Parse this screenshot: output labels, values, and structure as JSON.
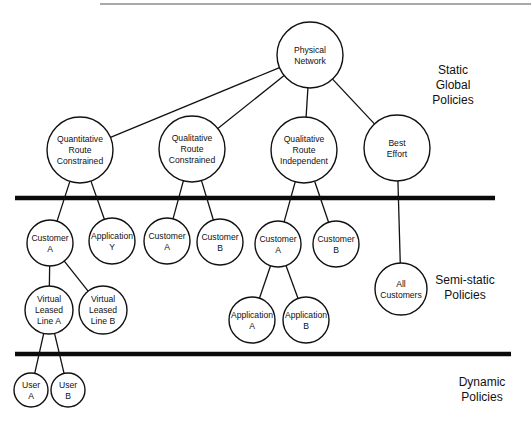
{
  "diagram": {
    "layers": [
      {
        "id": "static",
        "lines": [
          "Static",
          "Global",
          "Policies"
        ],
        "x": 453,
        "y": 74
      },
      {
        "id": "semi-static",
        "lines": [
          "Semi-static",
          "Policies"
        ],
        "x": 465,
        "y": 284
      },
      {
        "id": "dynamic",
        "lines": [
          "Dynamic",
          "Policies"
        ],
        "x": 482,
        "y": 386
      }
    ],
    "separators": [
      {
        "id": "top-rule",
        "x1": 100,
        "x2": 531,
        "y": 4,
        "kind": "thin"
      },
      {
        "id": "static-semistatic-divider",
        "x1": 15,
        "x2": 495,
        "y": 198,
        "kind": "thick"
      },
      {
        "id": "semistatic-dynamic-divider",
        "x1": 15,
        "x2": 511,
        "y": 354,
        "kind": "thick"
      }
    ],
    "nodes": [
      {
        "id": "physical-network",
        "lines": [
          "Physical",
          "Network"
        ],
        "cx": 310,
        "cy": 55,
        "r": 33
      },
      {
        "id": "quantitative-route-constrained",
        "lines": [
          "Quantitative",
          "Route",
          "Constrained"
        ],
        "cx": 80,
        "cy": 150,
        "r": 33
      },
      {
        "id": "qualitative-route-constrained",
        "lines": [
          "Qualitative",
          "Route",
          "Constrained"
        ],
        "cx": 192,
        "cy": 149,
        "r": 33
      },
      {
        "id": "qualitative-route-independent",
        "lines": [
          "Qualitative",
          "Route",
          "Independent"
        ],
        "cx": 304,
        "cy": 150,
        "r": 33
      },
      {
        "id": "best-effort",
        "lines": [
          "Best",
          "Effort"
        ],
        "cx": 397,
        "cy": 148,
        "r": 33
      },
      {
        "id": "qrc-customer-a",
        "lines": [
          "Customer",
          "A"
        ],
        "cx": 50,
        "cy": 243,
        "r": 23
      },
      {
        "id": "qrc-application-y",
        "lines": [
          "Application",
          "Y"
        ],
        "cx": 112,
        "cy": 241,
        "r": 23
      },
      {
        "id": "qlc-customer-a",
        "lines": [
          "Customer",
          "A"
        ],
        "cx": 167,
        "cy": 241,
        "r": 23
      },
      {
        "id": "qlc-customer-b",
        "lines": [
          "Customer",
          "B"
        ],
        "cx": 220,
        "cy": 242,
        "r": 23
      },
      {
        "id": "qli-customer-a",
        "lines": [
          "Customer",
          "A"
        ],
        "cx": 278,
        "cy": 244,
        "r": 23
      },
      {
        "id": "qli-customer-b",
        "lines": [
          "Customer",
          "B"
        ],
        "cx": 336,
        "cy": 244,
        "r": 23
      },
      {
        "id": "all-customers",
        "lines": [
          "All",
          "Customers"
        ],
        "cx": 401,
        "cy": 289,
        "r": 26
      },
      {
        "id": "virtual-leased-line-a",
        "lines": [
          "Virtual",
          "Leased",
          "Line A"
        ],
        "cx": 49,
        "cy": 310,
        "r": 24
      },
      {
        "id": "virtual-leased-line-b",
        "lines": [
          "Virtual",
          "Leased",
          "Line B"
        ],
        "cx": 103,
        "cy": 310,
        "r": 24
      },
      {
        "id": "application-a",
        "lines": [
          "Application",
          "A"
        ],
        "cx": 252,
        "cy": 320,
        "r": 23
      },
      {
        "id": "application-b",
        "lines": [
          "Application",
          "B"
        ],
        "cx": 306,
        "cy": 320,
        "r": 23
      },
      {
        "id": "user-a",
        "lines": [
          "User",
          "A"
        ],
        "cx": 31,
        "cy": 390,
        "r": 17
      },
      {
        "id": "user-b",
        "lines": [
          "User",
          "B"
        ],
        "cx": 68,
        "cy": 390,
        "r": 17
      }
    ],
    "edges": [
      [
        "physical-network",
        "quantitative-route-constrained"
      ],
      [
        "physical-network",
        "qualitative-route-constrained"
      ],
      [
        "physical-network",
        "qualitative-route-independent"
      ],
      [
        "physical-network",
        "best-effort"
      ],
      [
        "quantitative-route-constrained",
        "qrc-customer-a"
      ],
      [
        "quantitative-route-constrained",
        "qrc-application-y"
      ],
      [
        "qualitative-route-constrained",
        "qlc-customer-a"
      ],
      [
        "qualitative-route-constrained",
        "qlc-customer-b"
      ],
      [
        "qualitative-route-independent",
        "qli-customer-a"
      ],
      [
        "qualitative-route-independent",
        "qli-customer-b"
      ],
      [
        "best-effort",
        "all-customers"
      ],
      [
        "qrc-customer-a",
        "virtual-leased-line-a"
      ],
      [
        "qrc-customer-a",
        "virtual-leased-line-b"
      ],
      [
        "qli-customer-a",
        "application-a"
      ],
      [
        "qli-customer-a",
        "application-b"
      ],
      [
        "virtual-leased-line-a",
        "user-a"
      ],
      [
        "virtual-leased-line-a",
        "user-b"
      ]
    ]
  }
}
